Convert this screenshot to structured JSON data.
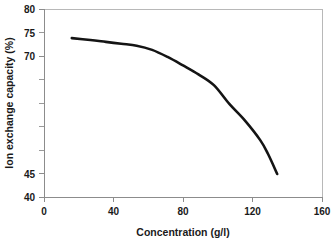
{
  "chart_data": {
    "type": "line",
    "title": "",
    "xlabel": "Concentration (g/l)",
    "ylabel": "Ion exchange capacity (%)",
    "xlim": [
      0,
      180
    ],
    "ylim": [
      40,
      80
    ],
    "grid": false,
    "legend": null,
    "x_ticks": [
      0,
      40,
      80,
      120,
      160
    ],
    "x_tick_labels": [
      "0",
      "40",
      "80",
      "120",
      "160"
    ],
    "y_ticks": [
      40,
      45,
      50,
      55,
      60,
      65,
      70,
      75,
      80
    ],
    "y_tick_labels": [
      "40",
      "45",
      "",
      "",
      "",
      "",
      "70",
      "75",
      "80"
    ],
    "series": [
      {
        "name": "Ion exchange capacity",
        "color": "#141414",
        "x": [
          18,
          30,
          40,
          50,
          60,
          70,
          80,
          90,
          100,
          110,
          120,
          130,
          140,
          145,
          151
        ],
        "y": [
          73.8,
          73.4,
          73.0,
          72.6,
          72.2,
          71.3,
          69.8,
          68.0,
          66.1,
          63.8,
          59.8,
          56.3,
          52.1,
          49.2,
          44.9
        ]
      }
    ]
  },
  "axis_titles": {
    "x": "Concentration (g/l)",
    "y": "Ion exchange capacity (%)"
  },
  "tick_labels": {
    "y_80": "80",
    "y_75": "75",
    "y_70": "70",
    "y_45": "45",
    "y_40": "40",
    "x_0": "0",
    "x_40": "40",
    "x_80": "80",
    "x_120": "120",
    "x_160": "160"
  }
}
